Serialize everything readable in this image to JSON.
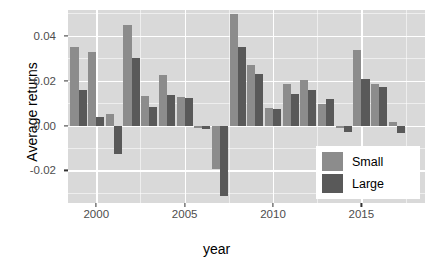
{
  "chart_data": {
    "type": "bar",
    "title": "",
    "subtitle": "",
    "xlabel": "year",
    "ylabel": "Average returns",
    "grid": true,
    "legend_position": "bottom-right",
    "xlim": [
      1998.4,
      2018.6
    ],
    "ylim": [
      -0.0345,
      0.0515
    ],
    "yticks": [
      0.04,
      0.02,
      0.0,
      -0.02
    ],
    "ytick_labels": [
      "0.04",
      "0.02",
      "0.00",
      "-0.02"
    ],
    "xticks": [
      2000,
      2005,
      2010,
      2015
    ],
    "xtick_labels": [
      "2000",
      "2005",
      "2010",
      "2015"
    ],
    "categories": [
      1999,
      2000,
      2001,
      2002,
      2003,
      2004,
      2005,
      2006,
      2007,
      2008,
      2009,
      2010,
      2011,
      2012,
      2013,
      2014,
      2015,
      2016,
      2017,
      2018
    ],
    "series": [
      {
        "name": "Small",
        "color": "#8c8c8c",
        "values": [
          0.035,
          0.033,
          0.005,
          0.045,
          0.013,
          0.0225,
          0.0128,
          -0.0012,
          -0.0195,
          0.0495,
          0.027,
          0.0078,
          0.0185,
          0.0205,
          0.0098,
          -0.0012,
          0.0335,
          0.0185,
          0.0018,
          0.0
        ]
      },
      {
        "name": "Large",
        "color": "#595959",
        "values": [
          0.016,
          0.004,
          -0.0125,
          0.03,
          0.0085,
          0.0137,
          0.0125,
          -0.0015,
          -0.0312,
          0.0352,
          0.023,
          0.0072,
          0.0142,
          0.0158,
          0.0118,
          -0.003,
          0.0208,
          0.017,
          -0.0035,
          0.0
        ]
      }
    ]
  },
  "legend": {
    "items": [
      {
        "label": "Small",
        "color": "#8c8c8c"
      },
      {
        "label": "Large",
        "color": "#595959"
      }
    ]
  }
}
